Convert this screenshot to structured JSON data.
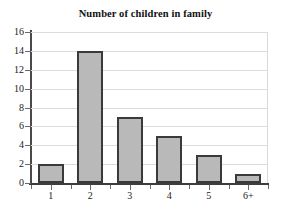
{
  "chart_data": {
    "type": "bar",
    "title": "Number of children in family",
    "xlabel": "",
    "ylabel": "",
    "categories": [
      "1",
      "2",
      "3",
      "4",
      "5",
      "6+"
    ],
    "values": [
      2,
      14,
      7,
      5,
      3,
      1
    ],
    "ylim": [
      0,
      16
    ],
    "ytick_labels": [
      "0",
      "2",
      "4",
      "6",
      "8",
      "10",
      "12",
      "14",
      "16"
    ],
    "ytick_values": [
      0,
      2,
      4,
      6,
      8,
      10,
      12,
      14,
      16
    ],
    "grid": true,
    "grid_axis": "y",
    "legend": false,
    "legend_position": "none",
    "bar_fill_color": "#b9b9b9",
    "bar_edge_color": "#3a3a3a",
    "gridline_color": "#dcdcdc",
    "axis_color": "#3d3d3d",
    "background_color": "#ffffff",
    "text_color": "#111111"
  }
}
